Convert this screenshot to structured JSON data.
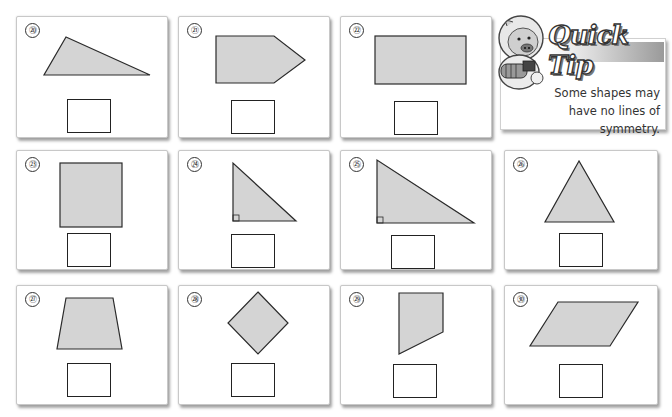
{
  "worksheet": {
    "rows": [
      [
        {
          "number": "⑳",
          "shape": "scalene-triangle",
          "label": "Problem 20"
        },
        {
          "number": "㉑",
          "shape": "pentagon-arrow",
          "label": "Problem 21"
        },
        {
          "number": "㉒",
          "shape": "rectangle",
          "label": "Problem 22"
        }
      ],
      [
        {
          "number": "㉓",
          "shape": "square",
          "label": "Problem 23"
        },
        {
          "number": "㉔",
          "shape": "right-triangle",
          "label": "Problem 24"
        },
        {
          "number": "㉕",
          "shape": "right-triangle-wide",
          "label": "Problem 25"
        },
        {
          "number": "㉖",
          "shape": "isosceles-triangle",
          "label": "Problem 26"
        }
      ],
      [
        {
          "number": "㉗",
          "shape": "isosceles-trapezoid",
          "label": "Problem 27"
        },
        {
          "number": "㉘",
          "shape": "rhombus-diamond",
          "label": "Problem 28"
        },
        {
          "number": "㉙",
          "shape": "irregular-quadrilateral",
          "label": "Problem 29"
        },
        {
          "number": "㉚",
          "shape": "parallelogram",
          "label": "Problem 30"
        }
      ]
    ],
    "answer_placeholder": ""
  },
  "quick_tip": {
    "title": "Quick Tip",
    "line1": "Some shapes may",
    "line2": "have no lines of symmetry.",
    "mascot": "pig-astronaut-mascot"
  },
  "colors": {
    "shape_fill": "#d4d4d4",
    "shape_stroke": "#2a2a2a",
    "card_border": "#c8c8c8"
  }
}
